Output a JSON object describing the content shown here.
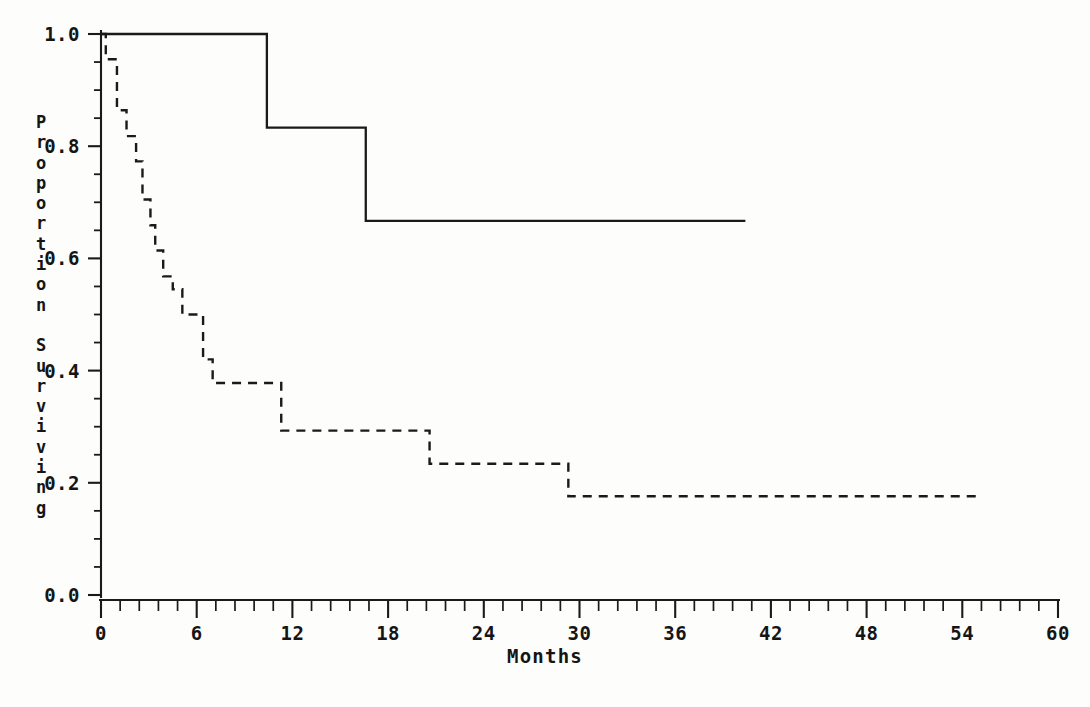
{
  "chart_data": {
    "type": "line",
    "title": "",
    "subtitle": "",
    "xlabel": "Months",
    "ylabel": "Proportion Surviving",
    "xlim": [
      0,
      60
    ],
    "ylim": [
      0.0,
      1.0
    ],
    "grid": false,
    "legend": "none",
    "x_ticks": [
      0,
      6,
      12,
      18,
      24,
      30,
      36,
      42,
      48,
      54,
      60
    ],
    "x_tick_labels": [
      "0",
      "6",
      "12",
      "18",
      "24",
      "30",
      "36",
      "42",
      "48",
      "54",
      "60"
    ],
    "x_minor_tick_interval": 1.2,
    "y_ticks": [
      0.0,
      0.2,
      0.4,
      0.6,
      0.8,
      1.0
    ],
    "y_tick_labels": [
      "0.0",
      "0.2",
      "0.4",
      "0.6",
      "0.8",
      "1.0"
    ],
    "y_minor_tick_interval": 0.05,
    "series": [
      {
        "name": "solid-curve",
        "style": "solid",
        "color": "#1a1a1a",
        "step": "post",
        "x": [
          0.0,
          10.4,
          10.4,
          16.6,
          16.6,
          40.4
        ],
        "y": [
          1.0,
          1.0,
          0.833,
          0.833,
          0.667,
          0.667
        ],
        "steps": [
          {
            "time": 0.0,
            "survival": 1.0
          },
          {
            "time": 10.4,
            "survival": 0.833
          },
          {
            "time": 16.6,
            "survival": 0.667
          },
          {
            "time": 40.4,
            "survival": 0.667
          }
        ]
      },
      {
        "name": "dashed-curve",
        "style": "dashed",
        "color": "#1a1a1a",
        "step": "post",
        "x": [
          0.0,
          0.3,
          0.3,
          1.0,
          1.0,
          1.6,
          1.6,
          2.2,
          2.2,
          2.6,
          2.6,
          3.1,
          3.1,
          3.4,
          3.4,
          3.9,
          3.9,
          4.5,
          4.5,
          5.1,
          5.1,
          5.6,
          5.6,
          6.4,
          6.4,
          7.0,
          7.0,
          11.3,
          11.3,
          20.6,
          20.6,
          29.3,
          29.3,
          55.0
        ],
        "y": [
          1.0,
          1.0,
          0.955,
          0.955,
          0.864,
          0.864,
          0.818,
          0.818,
          0.773,
          0.773,
          0.705,
          0.705,
          0.659,
          0.659,
          0.614,
          0.614,
          0.568,
          0.568,
          0.545,
          0.545,
          0.5,
          0.5,
          0.5,
          0.5,
          0.42,
          0.42,
          0.378,
          0.378,
          0.293,
          0.293,
          0.234,
          0.234,
          0.176,
          0.176
        ],
        "steps": [
          {
            "time": 0.0,
            "survival": 1.0
          },
          {
            "time": 0.3,
            "survival": 0.955
          },
          {
            "time": 1.0,
            "survival": 0.864
          },
          {
            "time": 1.6,
            "survival": 0.818
          },
          {
            "time": 2.2,
            "survival": 0.773
          },
          {
            "time": 2.6,
            "survival": 0.705
          },
          {
            "time": 3.1,
            "survival": 0.659
          },
          {
            "time": 3.4,
            "survival": 0.614
          },
          {
            "time": 3.9,
            "survival": 0.568
          },
          {
            "time": 4.5,
            "survival": 0.545
          },
          {
            "time": 5.1,
            "survival": 0.5
          },
          {
            "time": 6.4,
            "survival": 0.42
          },
          {
            "time": 7.0,
            "survival": 0.378
          },
          {
            "time": 11.3,
            "survival": 0.293
          },
          {
            "time": 20.6,
            "survival": 0.234
          },
          {
            "time": 29.3,
            "survival": 0.176
          },
          {
            "time": 55.0,
            "survival": 0.176
          }
        ]
      }
    ]
  },
  "axes": {
    "y_title_letters": [
      "P",
      "r",
      "o",
      "p",
      "o",
      "r",
      "t",
      "i",
      "o",
      "n",
      " ",
      "S",
      "u",
      "r",
      "v",
      "i",
      "v",
      "i",
      "n",
      "g"
    ],
    "x_title": "Months"
  },
  "colors": {
    "ink": "#1a1a1a",
    "paper": "#fdfdfc",
    "axis": "#1a1a1a"
  }
}
